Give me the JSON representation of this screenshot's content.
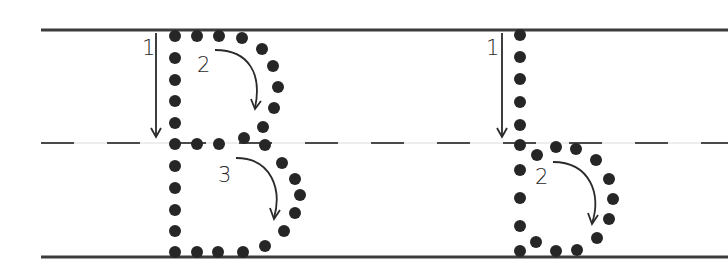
{
  "worksheet": {
    "colors": {
      "line": "#3c3c3c",
      "dot": "#262626",
      "dash": "#4a4a4a",
      "guide": "#d8d8d8",
      "arrow": "#2a2a2a"
    },
    "guides": {
      "top_y": 30,
      "mid_y": 143,
      "bottom_y": 257,
      "left_x": 41,
      "right_x": 728,
      "dash_length": 33,
      "dash_gap": 33
    },
    "letters": [
      {
        "name": "uppercase-B",
        "strokes": [
          {
            "number": "1",
            "label_x": 142,
            "label_y": 55,
            "type": "straight-down"
          },
          {
            "number": "2",
            "label_x": 197,
            "label_y": 72,
            "type": "curve-clockwise"
          },
          {
            "number": "3",
            "label_x": 218,
            "label_y": 182,
            "type": "curve-clockwise"
          }
        ]
      },
      {
        "name": "lowercase-b",
        "strokes": [
          {
            "number": "1",
            "label_x": 486,
            "label_y": 55,
            "type": "straight-down"
          },
          {
            "number": "2",
            "label_x": 535,
            "label_y": 184,
            "type": "curve-clockwise"
          }
        ]
      }
    ]
  }
}
